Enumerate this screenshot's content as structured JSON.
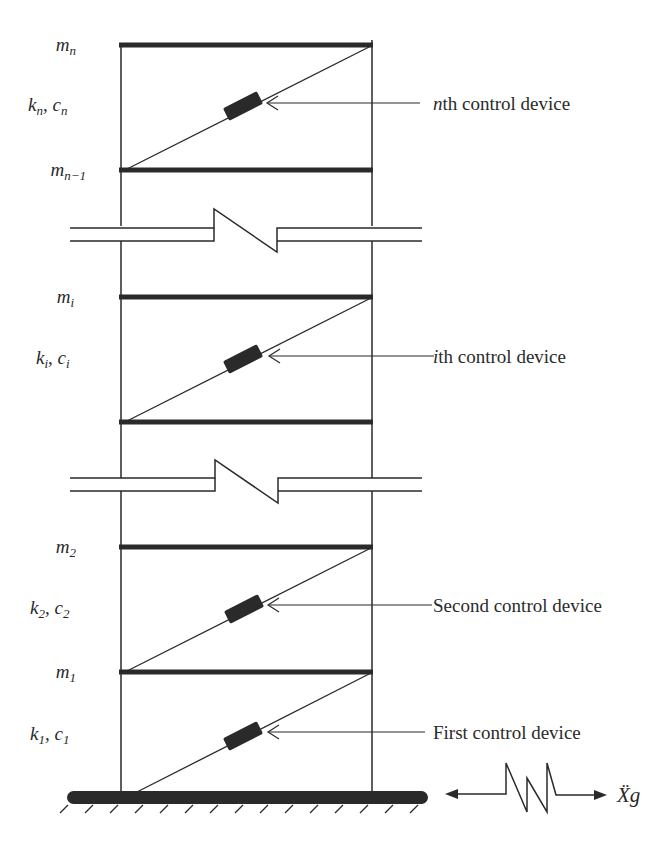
{
  "diagram": {
    "type": "multi-story shear building with inter-story control devices",
    "colors": {
      "stroke": "#2a2a2a",
      "background": "#ffffff"
    },
    "levels": [
      {
        "mass": {
          "base": "m",
          "sub": "n"
        },
        "beam_y": 45
      },
      {
        "mass": {
          "base": "m",
          "sub": "n−1"
        },
        "beam_y": 170
      },
      {
        "mass": {
          "base": "m",
          "sub": "i"
        },
        "beam_y": 297
      },
      {
        "mass": null,
        "beam_y": 422
      },
      {
        "mass": {
          "base": "m",
          "sub": "2"
        },
        "beam_y": 547
      },
      {
        "mass": {
          "base": "m",
          "sub": "1"
        },
        "beam_y": 672
      }
    ],
    "stories": [
      {
        "stiffness": {
          "base": "k",
          "sub": "n"
        },
        "damping": {
          "base": "c",
          "sub": "n"
        },
        "device_label": {
          "prefix": "n",
          "text": "th control device"
        }
      },
      {
        "stiffness": {
          "base": "k",
          "sub": "i"
        },
        "damping": {
          "base": "c",
          "sub": "i"
        },
        "device_label": {
          "prefix": "i",
          "text": "th control device"
        }
      },
      {
        "stiffness": {
          "base": "k",
          "sub": "2"
        },
        "damping": {
          "base": "c",
          "sub": "2"
        },
        "device_label": {
          "prefix": "",
          "text": "Second control device"
        }
      },
      {
        "stiffness": {
          "base": "k",
          "sub": "1"
        },
        "damping": {
          "base": "c",
          "sub": "1"
        },
        "device_label": {
          "prefix": "",
          "text": "First control device"
        }
      }
    ],
    "separator": ", ",
    "ground_excitation": {
      "symbol": "Ẍ",
      "sub": "g"
    }
  }
}
